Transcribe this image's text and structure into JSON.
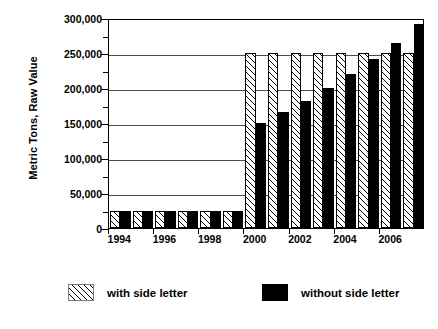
{
  "chart_data": {
    "type": "bar",
    "title": "",
    "subtitle": "",
    "xlabel": "",
    "ylabel": "Metric Tons, Raw Value",
    "ylim": [
      0,
      300000
    ],
    "ytick_interval": 50000,
    "yminor_interval": 25000,
    "grid": true,
    "grid_axis": "y",
    "legend_position": "bottom",
    "bar_mode": "grouped",
    "categories": [
      "1994",
      "1995",
      "1996",
      "1997",
      "1998",
      "1999",
      "2000",
      "2001",
      "2002",
      "2003",
      "2004",
      "2005",
      "2006",
      "2007"
    ],
    "xtick_labels": [
      "1994",
      "1996",
      "1998",
      "2000",
      "2002",
      "2004",
      "2006"
    ],
    "ytick_labels": [
      "0",
      "50,000",
      "100,000",
      "150,000",
      "200,000",
      "250,000",
      "300,000"
    ],
    "ytick_values": [
      0,
      50000,
      100000,
      150000,
      200000,
      250000,
      300000
    ],
    "series": [
      {
        "name": "with side letter",
        "pattern": "diagonal-hatch",
        "color": "#ffffff",
        "edge_color": "#000000",
        "values": [
          25000,
          25000,
          25000,
          25000,
          25000,
          25000,
          250000,
          250000,
          250000,
          250000,
          250000,
          250000,
          250000,
          250000
        ]
      },
      {
        "name": "without side letter",
        "pattern": "solid",
        "color": "#000000",
        "edge_color": "#000000",
        "values": [
          25000,
          25000,
          25000,
          25000,
          25000,
          25000,
          150000,
          166000,
          182000,
          200000,
          220000,
          242000,
          265000,
          292000
        ]
      }
    ]
  },
  "legend": {
    "items": [
      {
        "label": "with side letter",
        "swatch": "hatch-swatch"
      },
      {
        "label": "without side letter",
        "swatch": "solid-swatch"
      }
    ]
  },
  "axes": {
    "y_title": "Metric Tons, Raw Value"
  }
}
